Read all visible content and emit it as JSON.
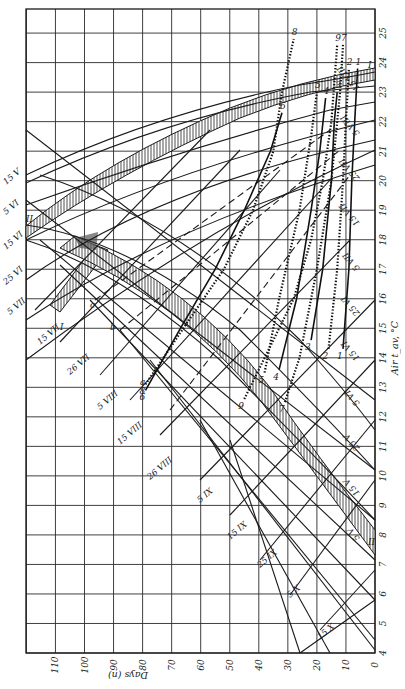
{
  "chart_data": {
    "type": "line",
    "title": "",
    "xlabel": "Days (n)",
    "ylabel": "Air t_av, °C",
    "orientation_note_visible": "figure printed rotated 90°",
    "x_axis": {
      "label": "Days (n)",
      "ticks": [
        110,
        100,
        90,
        80,
        70,
        60,
        50,
        40,
        30,
        20,
        10,
        0
      ],
      "range": [
        0,
        120
      ],
      "direction": "decreasing left-to-right"
    },
    "y_axis": {
      "label": "Air t_av, °C",
      "ticks": [
        4,
        5,
        6,
        7,
        8,
        9,
        10,
        11,
        12,
        13,
        14,
        15,
        16,
        17,
        18,
        19,
        20,
        21,
        22,
        23,
        24,
        25
      ],
      "range": [
        4,
        25.8
      ]
    },
    "grid": true,
    "date_isolines_left": [
      "15 V",
      "5 VI",
      "15 VI",
      "25 VI",
      "5 VII",
      "15 VII",
      "26 VII",
      "5 VIII",
      "15 VIII",
      "26 VIII",
      "5 IX",
      "15 IX",
      "25 IX",
      "5 X",
      "15 X"
    ],
    "date_isolines_right": [
      "15 VIII",
      "5 VIII",
      "25 VII",
      "15 VII",
      "5 VII",
      "25 VI",
      "15 VI",
      "5 VI",
      "25 V",
      "15 V",
      "5 V"
    ],
    "bands": [
      {
        "name": "I",
        "description": "upper hatched band"
      },
      {
        "name": "II",
        "description": "lower hatched band"
      }
    ],
    "dashed_lines": [
      "a",
      "b",
      "c"
    ],
    "series": [
      {
        "name": "1",
        "style": "solid",
        "points": [
          [
            11,
            14.3
          ],
          [
            9,
            17
          ],
          [
            8,
            20
          ],
          [
            7,
            22
          ],
          [
            6,
            23.8
          ]
        ]
      },
      {
        "name": "2",
        "style": "dotted",
        "points": [
          [
            16,
            14.3
          ],
          [
            13,
            17
          ],
          [
            11,
            20
          ],
          [
            10,
            22
          ],
          [
            9,
            23.8
          ]
        ]
      },
      {
        "name": "3",
        "style": "solid",
        "points": [
          [
            22,
            14.6
          ],
          [
            18,
            17
          ],
          [
            15,
            20
          ],
          [
            14,
            22
          ],
          [
            13,
            23
          ]
        ]
      },
      {
        "name": "4",
        "style": "solid",
        "points": [
          [
            33,
            13.6
          ],
          [
            27,
            16
          ],
          [
            22,
            19
          ],
          [
            19,
            21
          ],
          [
            17,
            22.8
          ]
        ]
      },
      {
        "name": "5",
        "style": "dotted",
        "points": [
          [
            38,
            13.5
          ],
          [
            33,
            16
          ],
          [
            26,
            19
          ],
          [
            22,
            21.5
          ],
          [
            20,
            23
          ]
        ]
      },
      {
        "name": "6",
        "style": "solid",
        "points": [
          [
            79,
            12.9
          ],
          [
            67,
            15
          ],
          [
            55,
            17
          ],
          [
            45,
            19
          ],
          [
            36,
            21
          ],
          [
            32,
            22.3
          ]
        ]
      },
      {
        "name": "7",
        "style": "dotted",
        "points": [
          [
            31,
            12.5
          ],
          [
            26,
            14
          ],
          [
            20,
            17
          ],
          [
            15,
            20
          ],
          [
            12,
            23
          ],
          [
            11,
            24.6
          ]
        ]
      },
      {
        "name": "8",
        "style": "dotted",
        "points": [
          [
            79,
            13.1
          ],
          [
            66,
            15
          ],
          [
            52,
            17
          ],
          [
            42,
            19
          ],
          [
            35,
            21
          ],
          [
            32,
            23
          ],
          [
            28,
            24.8
          ]
        ]
      },
      {
        "name": "9",
        "style": "dotted",
        "points": [
          [
            45,
            12.6
          ],
          [
            38,
            14
          ],
          [
            28,
            16
          ],
          [
            22,
            18
          ],
          [
            18,
            20
          ],
          [
            15,
            22
          ],
          [
            13,
            24.6
          ]
        ]
      }
    ],
    "curve_labels": [
      "1",
      "2",
      "3",
      "4",
      "5",
      "6",
      "7",
      "8",
      "9"
    ],
    "axis_frame_labels": {
      "band_I_right": "I",
      "band_II_right": "II",
      "band_I_left": "I",
      "band_II_left": "II"
    }
  }
}
